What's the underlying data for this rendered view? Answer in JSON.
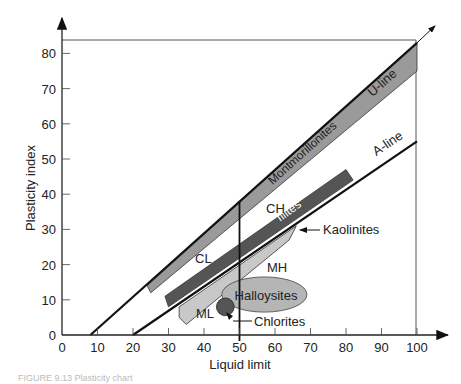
{
  "chart_data": {
    "type": "line",
    "title": "Plasticity chart",
    "xlabel": "Liquid limit",
    "ylabel": "Plasticity index",
    "xlim": [
      0,
      100
    ],
    "ylim": [
      0,
      85
    ],
    "x_ticks": [
      0,
      10,
      20,
      30,
      40,
      50,
      60,
      70,
      80,
      90,
      100
    ],
    "y_ticks": [
      0,
      10,
      20,
      30,
      40,
      50,
      60,
      70,
      80
    ],
    "grid": false,
    "series": [
      {
        "name": "U-line",
        "x": [
          8,
          100
        ],
        "y": [
          0,
          83
        ]
      },
      {
        "name": "A-line",
        "x": [
          20,
          100
        ],
        "y": [
          0,
          55
        ]
      },
      {
        "name": "LL = 50 divider",
        "x": [
          50,
          50
        ],
        "y": [
          0,
          38
        ]
      }
    ],
    "regions": [
      {
        "name": "Montmorillonites",
        "shade": "#9a9a9a",
        "polygon": [
          [
            24,
            14
          ],
          [
            100,
            83
          ],
          [
            100,
            75
          ],
          [
            25,
            12
          ]
        ]
      },
      {
        "name": "Illites",
        "shade": "#555555",
        "polygon": [
          [
            29,
            11
          ],
          [
            80,
            47
          ],
          [
            82,
            44
          ],
          [
            30,
            8
          ]
        ]
      },
      {
        "name": "Kaolinites",
        "shade": "#c8c8c8",
        "polygon": [
          [
            33,
            5
          ],
          [
            33,
            8
          ],
          [
            66,
            31
          ],
          [
            64,
            27
          ],
          [
            35,
            3
          ]
        ]
      },
      {
        "name": "Halloysites",
        "shade": "#b5b5b5",
        "ellipse": {
          "cx": 57,
          "cy": 11.5,
          "rx": 12,
          "ry": 5
        }
      },
      {
        "name": "Chlorites",
        "shade": "#555555",
        "circle": {
          "cx": 46,
          "cy": 8,
          "r": 2.5
        }
      }
    ],
    "zone_labels": [
      {
        "text": "CH",
        "x": 56,
        "y": 35
      },
      {
        "text": "CL",
        "x": 40,
        "y": 22
      },
      {
        "text": "MH",
        "x": 62,
        "y": 17
      },
      {
        "text": "ML",
        "x": 39,
        "y": 6
      }
    ],
    "annotations": [
      {
        "text": "U-line",
        "x": 93,
        "y": 75
      },
      {
        "text": "A-line",
        "x": 93,
        "y": 50
      },
      {
        "text": "Montmorillonites",
        "x": 68,
        "y": 46
      },
      {
        "text": "Illites",
        "x": 60,
        "y": 31
      },
      {
        "text": "Kaolinites",
        "x": 73,
        "y": 30
      },
      {
        "text": "Halloysites",
        "x": 57,
        "y": 11
      },
      {
        "text": "Chlorites",
        "x": 55,
        "y": 3
      }
    ],
    "legend": null
  },
  "axes": {
    "xlabel": "Liquid limit",
    "ylabel": "Plasticity index",
    "x_tick_labels": [
      "0",
      "10",
      "20",
      "30",
      "40",
      "50",
      "60",
      "70",
      "80",
      "90",
      "100"
    ],
    "y_tick_labels": [
      "0",
      "10",
      "20",
      "30",
      "40",
      "50",
      "60",
      "70",
      "80"
    ],
    "origin_label": "0"
  },
  "labels": {
    "u_line": "U-line",
    "a_line": "A-line",
    "montmorillonites": "Montmorillonites",
    "illites": "Illites",
    "kaolinites": "Kaolinites",
    "halloysites": "Halloysites",
    "chlorites": "Chlorites",
    "ch": "CH",
    "cl": "CL",
    "mh": "MH",
    "ml": "ML"
  },
  "caption": "FIGURE 9.13  Plasticity chart"
}
